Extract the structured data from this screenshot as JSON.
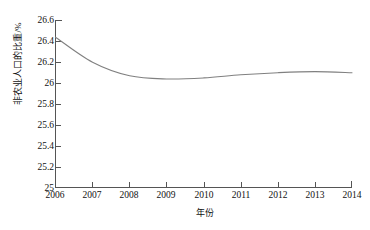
{
  "chart_data": {
    "type": "line",
    "title": "",
    "subtitle": "",
    "xlabel": "年份",
    "ylabel": "非农业人口的比重/%",
    "x": [
      2006,
      2007,
      2008,
      2009,
      2010,
      2011,
      2012,
      2013,
      2014
    ],
    "xtick_labels": [
      "2006",
      "2007",
      "2008",
      "2009",
      "2010",
      "2011",
      "2012",
      "2013",
      "2014"
    ],
    "ytick_labels": [
      "26.6",
      "26.4",
      "26.2",
      "26",
      "25.8",
      "25.6",
      "25.4",
      "25.2",
      "25"
    ],
    "ytick_values": [
      26.6,
      26.4,
      26.2,
      26.0,
      25.8,
      25.6,
      25.4,
      25.2,
      25.0
    ],
    "xlim": [
      2006,
      2014
    ],
    "ylim": [
      25.0,
      26.6
    ],
    "grid": false,
    "legend": null,
    "legend_position": "none",
    "line_color": "#808080",
    "axis_color": "#555555",
    "background": "#ffffff",
    "series": [
      {
        "name": "非农业人口的比重",
        "values": [
          26.44,
          26.2,
          26.07,
          26.04,
          26.05,
          26.08,
          26.1,
          26.11,
          26.1
        ]
      }
    ]
  },
  "axes": {
    "x_title": "年份",
    "y_title": "非农业人口的比重/%"
  }
}
